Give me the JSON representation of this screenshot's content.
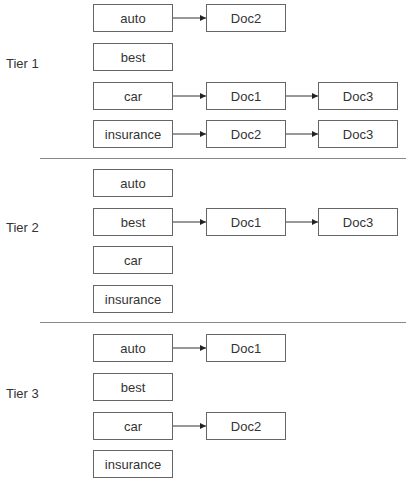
{
  "tiers": [
    {
      "label": "Tier 1",
      "terms": [
        {
          "term": "auto",
          "postings": [
            "Doc2"
          ]
        },
        {
          "term": "best",
          "postings": []
        },
        {
          "term": "car",
          "postings": [
            "Doc1",
            "Doc3"
          ]
        },
        {
          "term": "insurance",
          "postings": [
            "Doc2",
            "Doc3"
          ]
        }
      ]
    },
    {
      "label": "Tier 2",
      "terms": [
        {
          "term": "auto",
          "postings": []
        },
        {
          "term": "best",
          "postings": [
            "Doc1",
            "Doc3"
          ]
        },
        {
          "term": "car",
          "postings": []
        },
        {
          "term": "insurance",
          "postings": []
        }
      ]
    },
    {
      "label": "Tier 3",
      "terms": [
        {
          "term": "auto",
          "postings": [
            "Doc1"
          ]
        },
        {
          "term": "best",
          "postings": []
        },
        {
          "term": "car",
          "postings": [
            "Doc2"
          ]
        },
        {
          "term": "insurance",
          "postings": []
        }
      ]
    }
  ]
}
